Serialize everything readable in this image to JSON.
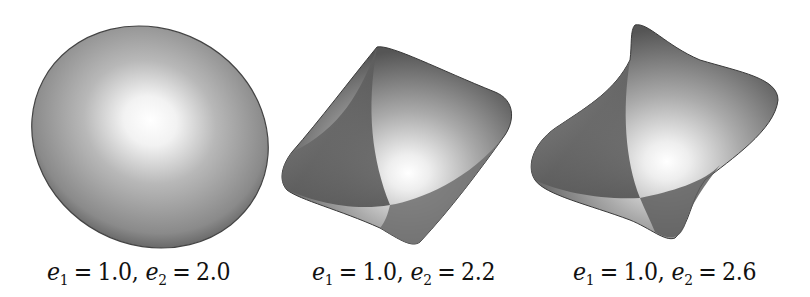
{
  "figure": {
    "panels": [
      {
        "shape": "ellipsoid",
        "caption": {
          "e1_symbol": "e",
          "e1_sub": "1",
          "e1_value": "1.0",
          "e2_symbol": "e",
          "e2_sub": "2",
          "e2_value": "2.0"
        }
      },
      {
        "shape": "superquadric-pinched",
        "caption": {
          "e1_symbol": "e",
          "e1_sub": "1",
          "e1_value": "1.0",
          "e2_symbol": "e",
          "e2_sub": "2",
          "e2_value": "2.2"
        }
      },
      {
        "shape": "superquadric-star",
        "caption": {
          "e1_symbol": "e",
          "e1_sub": "1",
          "e1_value": "1.0",
          "e2_symbol": "e",
          "e2_sub": "2",
          "e2_value": "2.6"
        }
      }
    ],
    "operators": {
      "equals": "=",
      "comma": ","
    },
    "colors": {
      "background": "#ffffff",
      "surface_dark": "#3a3a3a",
      "surface_mid": "#8c8c8c",
      "highlight": "#ffffff"
    }
  }
}
